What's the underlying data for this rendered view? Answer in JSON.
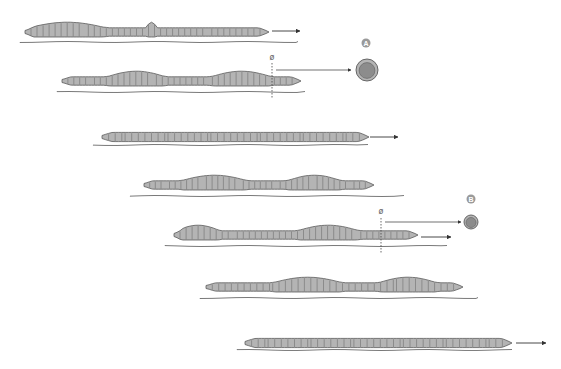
{
  "diagram": {
    "colors": {
      "body_fill": "#b4b4b4",
      "body_stroke": "#5a5a5a",
      "segment_line": "#6e6e6e",
      "ground": "#6a6a6a",
      "arrow": "#333333",
      "badge": "#9a9a9a",
      "cross_section_fill": "#8c8c8c"
    },
    "labels": {
      "section_a": "A",
      "section_b": "B",
      "diameter_symbol": "ø"
    },
    "worms": [
      {
        "id": 1,
        "x1": 25,
        "x2": 266,
        "cy": 32,
        "ground_y": 42,
        "ground_x1": 20,
        "ground_x2": 298,
        "bulges": [
          [
            0.0,
            0.35
          ],
          [
            0.5,
            0.55
          ]
        ],
        "arrow": [
          272,
          31,
          300
        ]
      },
      {
        "id": 2,
        "x1": 62,
        "x2": 298,
        "cy": 81,
        "ground_y": 92,
        "ground_x1": 57,
        "ground_x2": 305,
        "bulges": [
          [
            0.18,
            0.45
          ],
          [
            0.62,
            0.9
          ]
        ],
        "cross_section": "A"
      },
      {
        "id": 3,
        "x1": 102,
        "x2": 366,
        "cy": 137,
        "ground_y": 145,
        "ground_x1": 93,
        "ground_x2": 368,
        "bulges": [],
        "arrow": [
          370,
          137,
          398
        ]
      },
      {
        "id": 4,
        "x1": 144,
        "x2": 371,
        "cy": 185,
        "ground_y": 196,
        "ground_x1": 130,
        "ground_x2": 404,
        "bulges": [
          [
            0.15,
            0.47
          ],
          [
            0.62,
            0.88
          ]
        ]
      },
      {
        "id": 5,
        "x1": 174,
        "x2": 415,
        "cy": 235,
        "ground_y": 246,
        "ground_x1": 165,
        "ground_x2": 447,
        "bulges": [
          [
            0.0,
            0.2
          ],
          [
            0.5,
            0.78
          ]
        ],
        "arrow": [
          421,
          237,
          451
        ],
        "cross_section": "B"
      },
      {
        "id": 6,
        "x1": 206,
        "x2": 460,
        "cy": 287,
        "ground_y": 298,
        "ground_x1": 200,
        "ground_x2": 478,
        "bulges": [
          [
            0.25,
            0.55
          ],
          [
            0.67,
            0.92
          ]
        ]
      },
      {
        "id": 7,
        "x1": 245,
        "x2": 509,
        "cy": 343,
        "ground_y": 350,
        "ground_x1": 237,
        "ground_x2": 512,
        "bulges": [],
        "arrow": [
          516,
          343,
          546
        ]
      }
    ],
    "cross_sections": [
      {
        "label": "A",
        "badge_x": 366,
        "badge_y": 43,
        "cx": 367,
        "cy": 70,
        "r": 11,
        "dashed_x": 272,
        "dashed_y1": 63,
        "dashed_y2": 99,
        "phi_y": 60,
        "arrow_y": 70,
        "arrow_x1": 276,
        "arrow_x2": 351
      },
      {
        "label": "B",
        "badge_x": 471,
        "badge_y": 199,
        "cx": 471,
        "cy": 222,
        "r": 7,
        "dashed_x": 381,
        "dashed_y1": 218,
        "dashed_y2": 253,
        "phi_y": 214,
        "arrow_y": 222,
        "arrow_x1": 385,
        "arrow_x2": 461
      }
    ]
  }
}
